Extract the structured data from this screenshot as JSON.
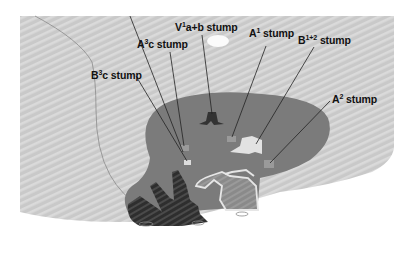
{
  "diagram": {
    "type": "anatomical-illustration",
    "colors": {
      "background": "#ffffff",
      "lung_field": "#c8c8c8",
      "lung_stripe": "#d8d8d8",
      "mediastinal_region": "#7a7a7a",
      "bronchus_dark": "#3a3a3a",
      "bronchus_mid": "#8f8f8f",
      "stump_light": "#e4e4e4",
      "leader_line": "#222222",
      "outline": "#8a8a8a"
    },
    "labels": [
      {
        "id": "v1ab",
        "base": "V",
        "sup": "1",
        "rest": "a+b stump"
      },
      {
        "id": "a3c",
        "base": "A",
        "sup": "3",
        "rest": "c stump"
      },
      {
        "id": "a1",
        "base": "A",
        "sup": "1",
        "rest": " stump"
      },
      {
        "id": "b12",
        "base": "B",
        "sup": "1+2",
        "rest": " stump"
      },
      {
        "id": "b3c",
        "base": "B",
        "sup": "3",
        "rest": "c stump"
      },
      {
        "id": "a2",
        "base": "A",
        "sup": "2",
        "rest": " stump"
      }
    ]
  }
}
